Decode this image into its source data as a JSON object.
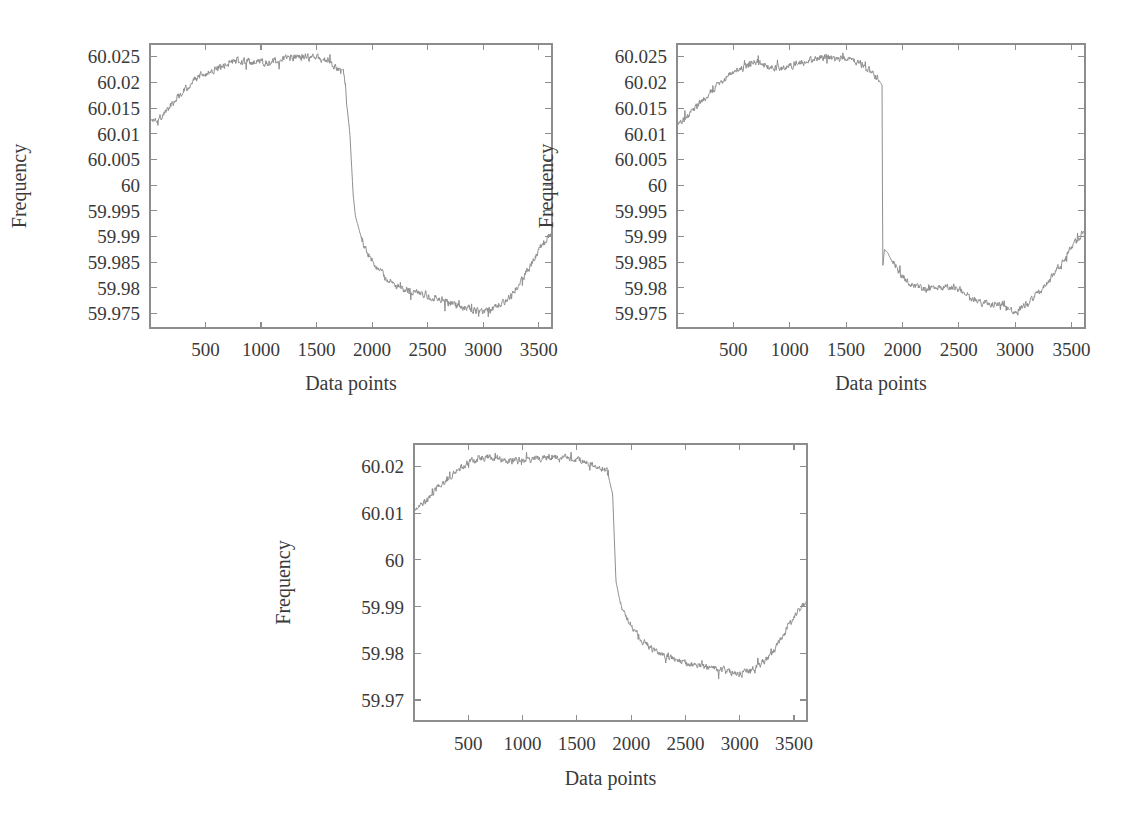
{
  "figure": {
    "background_color": "#ffffff",
    "trace_color": "#8f8f8f",
    "axis_color": "#8d8d8d",
    "text_color": "#3a3a3a",
    "panel_count": 3
  },
  "chart_data": [
    {
      "id": "panel-top-left",
      "type": "line",
      "title": "",
      "xlabel": "Data points",
      "ylabel": "Frequency",
      "xlim": [
        0,
        3620
      ],
      "ylim": [
        59.9722,
        60.0275
      ],
      "grid": false,
      "legend": null,
      "xticks": [
        500,
        1000,
        1500,
        2000,
        2500,
        3000,
        3500
      ],
      "xticklabels": [
        "500",
        "1000",
        "1500",
        "2000",
        "2500",
        "3000",
        "3500"
      ],
      "yticks": [
        59.975,
        59.98,
        59.985,
        59.99,
        59.995,
        60,
        60.005,
        60.01,
        60.015,
        60.02,
        60.025
      ],
      "yticklabels": [
        "59.975",
        "59.98",
        "59.985",
        "59.99",
        "59.995",
        "60",
        "60.005",
        "60.01",
        "60.015",
        "60.02",
        "60.025"
      ],
      "series": [
        {
          "name": "frequency",
          "noise_amplitude": 0.0011,
          "x": [
            0,
            100,
            200,
            300,
            400,
            500,
            600,
            700,
            800,
            900,
            1000,
            1100,
            1200,
            1300,
            1400,
            1500,
            1600,
            1700,
            1750,
            1800,
            1830,
            1850,
            1900,
            1950,
            2000,
            2100,
            2200,
            2300,
            2400,
            2500,
            2600,
            2700,
            2800,
            2900,
            3000,
            3100,
            3200,
            3300,
            3400,
            3500,
            3600
          ],
          "y": [
            60.0125,
            60.0133,
            60.016,
            60.0185,
            60.0205,
            60.0218,
            60.0228,
            60.0238,
            60.0243,
            60.024,
            60.0238,
            60.024,
            60.0245,
            60.025,
            60.0248,
            60.0248,
            60.0242,
            60.0228,
            60.0215,
            60.01,
            59.998,
            59.994,
            59.99,
            59.987,
            59.9855,
            59.9825,
            59.9805,
            59.9798,
            59.9792,
            59.9785,
            59.9778,
            59.9772,
            59.9765,
            59.9758,
            59.9752,
            59.976,
            59.9775,
            59.98,
            59.9835,
            59.9875,
            59.9905
          ]
        }
      ]
    },
    {
      "id": "panel-top-right",
      "type": "line",
      "title": "",
      "xlabel": "Data points",
      "ylabel": "Frequency",
      "xlim": [
        0,
        3620
      ],
      "ylim": [
        59.9722,
        60.0275
      ],
      "grid": false,
      "legend": null,
      "xticks": [
        500,
        1000,
        1500,
        2000,
        2500,
        3000,
        3500
      ],
      "xticklabels": [
        "500",
        "1000",
        "1500",
        "2000",
        "2500",
        "3000",
        "3500"
      ],
      "yticks": [
        59.975,
        59.98,
        59.985,
        59.99,
        59.995,
        60,
        60.005,
        60.01,
        60.015,
        60.02,
        60.025
      ],
      "yticklabels": [
        "59.975",
        "59.98",
        "59.985",
        "59.99",
        "59.995",
        "60",
        "60.005",
        "60.01",
        "60.015",
        "60.02",
        "60.025"
      ],
      "series": [
        {
          "name": "frequency",
          "noise_amplitude": 0.001,
          "x": [
            0,
            100,
            200,
            300,
            400,
            500,
            600,
            700,
            800,
            900,
            1000,
            1100,
            1200,
            1300,
            1400,
            1500,
            1600,
            1700,
            1780,
            1820,
            1825,
            1840,
            1870,
            1900,
            1950,
            2000,
            2100,
            2200,
            2300,
            2400,
            2500,
            2600,
            2700,
            2800,
            2900,
            3000,
            3100,
            3200,
            3300,
            3400,
            3500,
            3600
          ],
          "y": [
            60.0118,
            60.0135,
            60.016,
            60.0182,
            60.0202,
            60.0222,
            60.0232,
            60.024,
            60.0232,
            60.0228,
            60.0232,
            60.0238,
            60.0245,
            60.025,
            60.0246,
            60.0248,
            60.024,
            60.0225,
            60.0208,
            60.0195,
            59.984,
            59.9875,
            59.9868,
            59.9855,
            59.984,
            59.9822,
            59.9805,
            59.9798,
            59.98,
            59.9802,
            59.9798,
            59.978,
            59.9772,
            59.977,
            59.9766,
            59.9752,
            59.977,
            59.9788,
            59.9812,
            59.9845,
            59.9878,
            59.9908
          ]
        }
      ]
    },
    {
      "id": "panel-bottom-center",
      "type": "line",
      "title": "",
      "xlabel": "Data points",
      "ylabel": "Frequency",
      "xlim": [
        0,
        3620
      ],
      "ylim": [
        59.9655,
        60.0248
      ],
      "grid": false,
      "legend": null,
      "xticks": [
        500,
        1000,
        1500,
        2000,
        2500,
        3000,
        3500
      ],
      "xticklabels": [
        "500",
        "1000",
        "1500",
        "2000",
        "2500",
        "3000",
        "3500"
      ],
      "yticks": [
        59.97,
        59.98,
        59.99,
        60,
        60.01,
        60.02
      ],
      "yticklabels": [
        "59.97",
        "59.98",
        "59.99",
        "60",
        "60.01",
        "60.02"
      ],
      "series": [
        {
          "name": "frequency",
          "noise_amplitude": 0.0011,
          "x": [
            0,
            100,
            200,
            300,
            400,
            500,
            600,
            700,
            800,
            900,
            1000,
            1100,
            1200,
            1300,
            1400,
            1500,
            1600,
            1700,
            1780,
            1830,
            1860,
            1900,
            1950,
            2000,
            2100,
            2200,
            2300,
            2400,
            2500,
            2600,
            2700,
            2800,
            2900,
            3000,
            3100,
            3200,
            3300,
            3400,
            3500,
            3600
          ],
          "y": [
            60.0108,
            60.0125,
            60.015,
            60.0172,
            60.0192,
            60.0208,
            60.0218,
            60.022,
            60.0215,
            60.0212,
            60.0212,
            60.0215,
            60.0218,
            60.022,
            60.0218,
            60.0215,
            60.0208,
            60.0198,
            60.019,
            60.014,
            59.9955,
            59.9908,
            59.988,
            59.9858,
            59.9828,
            59.9805,
            59.9795,
            59.979,
            59.9782,
            59.9776,
            59.977,
            59.9766,
            59.9762,
            59.9755,
            59.9765,
            59.9778,
            59.98,
            59.984,
            59.9878,
            59.9905
          ]
        }
      ]
    }
  ]
}
